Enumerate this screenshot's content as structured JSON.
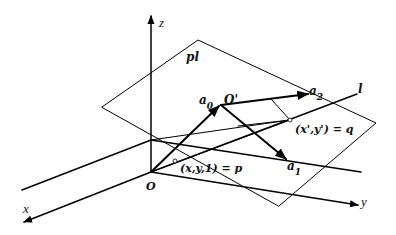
{
  "diagram": {
    "type": "3D geometry: plane projection",
    "axes": {
      "x": {
        "label": "x"
      },
      "y": {
        "label": "y"
      },
      "z": {
        "label": "z"
      },
      "origin": {
        "label": "O"
      }
    },
    "plane": {
      "label": "pl"
    },
    "line": {
      "label": "l"
    },
    "points": {
      "plane_origin": {
        "label": "O'"
      },
      "p": {
        "label": "(x,y,1) = p"
      },
      "q": {
        "label": "(x',y') = q"
      }
    },
    "vectors": {
      "a0": {
        "base": "a",
        "sub": "0"
      },
      "a1": {
        "base": "a",
        "sub": "1"
      },
      "a2": {
        "base": "a",
        "sub": "2"
      }
    }
  }
}
